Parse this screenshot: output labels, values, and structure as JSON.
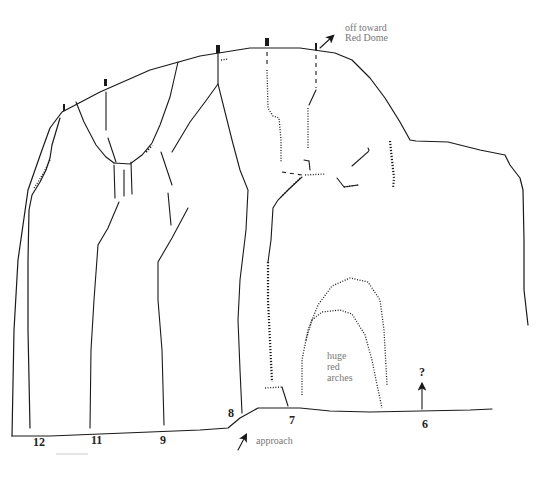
{
  "diagram": {
    "type": "climbing-route-topo",
    "route_labels": [
      {
        "id": "12",
        "text": "12"
      },
      {
        "id": "11",
        "text": "11"
      },
      {
        "id": "9",
        "text": "9"
      },
      {
        "id": "8",
        "text": "8"
      },
      {
        "id": "7",
        "text": "7"
      },
      {
        "id": "6",
        "text": "6"
      }
    ],
    "annotations": {
      "off_toward_line1": "off toward",
      "off_toward_line2": "Red Dome",
      "arches_line1": "huge",
      "arches_line2": "red",
      "arches_line3": "arches",
      "approach": "approach",
      "unknown_route_mark": "?"
    },
    "icons": {
      "anchor": "belay-anchor-icon",
      "arrow": "arrow-icon"
    },
    "colors": {
      "ink": "#1a1a1a",
      "note_text": "#777777",
      "background": "#ffffff"
    }
  }
}
